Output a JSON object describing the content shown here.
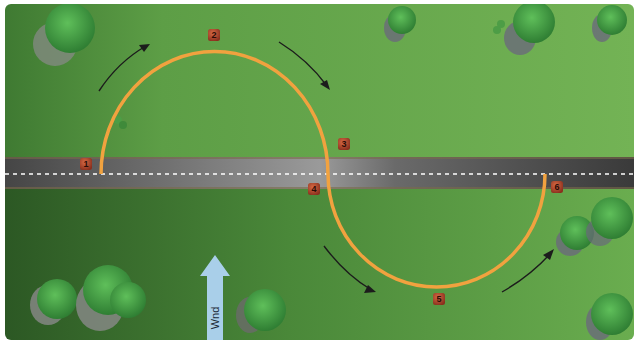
{
  "diagram": {
    "type": "aerial-flight-path",
    "colors": {
      "field_light": "#6cae4f",
      "field_dark": "#2f5c28",
      "road": "#5a5a5a",
      "road_centerline": "#ffffff",
      "path": "#f1a23f",
      "marker": "#a8402a",
      "arrow": "#1c1c1c",
      "wind_arrow": "#a9cfe9"
    },
    "road": {
      "label": "road",
      "y_center": 174,
      "centerline": "dashed"
    },
    "path": {
      "shape": "S-turns across road",
      "segments": [
        {
          "name": "upper-semicircle",
          "from": [
            101,
            174
          ],
          "apex": [
            214,
            52
          ],
          "to": [
            328,
            174
          ]
        },
        {
          "name": "lower-semicircle",
          "from": [
            328,
            174
          ],
          "apex": [
            437,
            287
          ],
          "to": [
            545,
            174
          ]
        }
      ]
    },
    "markers": [
      {
        "label": "1",
        "x": 86,
        "y": 164
      },
      {
        "label": "2",
        "x": 214,
        "y": 35
      },
      {
        "label": "3",
        "x": 344,
        "y": 144
      },
      {
        "label": "4",
        "x": 314,
        "y": 189
      },
      {
        "label": "5",
        "x": 439,
        "y": 299
      },
      {
        "label": "6",
        "x": 557,
        "y": 187
      }
    ],
    "direction_arrows": [
      {
        "name": "arrow-upper-left",
        "direction": "up-right"
      },
      {
        "name": "arrow-upper-right",
        "direction": "down-right"
      },
      {
        "name": "arrow-lower-left",
        "direction": "down-right"
      },
      {
        "name": "arrow-lower-right",
        "direction": "up-right"
      }
    ],
    "wind": {
      "label": "Wnd",
      "direction": "north"
    }
  }
}
